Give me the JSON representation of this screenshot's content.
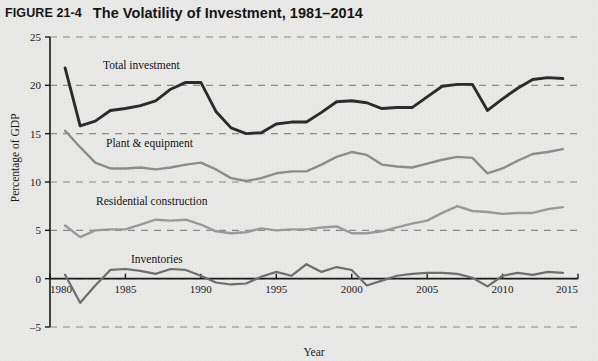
{
  "figure": {
    "number": "FIGURE 21-4",
    "title": "The Volatility of Investment, 1981–2014"
  },
  "colors": {
    "background": "#e9e9e7",
    "total_investment": "#2b2b2b",
    "plant_equipment": "#8d8d8d",
    "residential_construction": "#9a9a9a",
    "inventories": "#6e6e6e",
    "gridline": "#8c8c8c",
    "axis": "#1a1a1a"
  },
  "chart_data": {
    "type": "line",
    "title": "The Volatility of Investment, 1981–2014",
    "xlabel": "Year",
    "ylabel": "Percentage of GDP",
    "xlim": [
      1980,
      2015
    ],
    "ylim": [
      -5,
      25
    ],
    "xticks": [
      1980,
      1985,
      1990,
      1995,
      2000,
      2005,
      2010,
      2015
    ],
    "yticks": [
      -5,
      0,
      5,
      10,
      15,
      20,
      25
    ],
    "xticklabels": [
      "1980",
      "1985",
      "1990",
      "1995",
      "2000",
      "2005",
      "2010",
      "2015"
    ],
    "yticklabels": [
      "–5",
      "0",
      "5",
      "10",
      "15",
      "20",
      "25"
    ],
    "grid": "horizontal-dashed",
    "legend_position": "inline-labels",
    "x": [
      1981,
      1982,
      1983,
      1984,
      1985,
      1986,
      1987,
      1988,
      1989,
      1990,
      1991,
      1992,
      1993,
      1994,
      1995,
      1996,
      1997,
      1998,
      1999,
      2000,
      2001,
      2002,
      2003,
      2004,
      2005,
      2006,
      2007,
      2008,
      2009,
      2010,
      2011,
      2012,
      2013,
      2014
    ],
    "series": [
      {
        "name": "Total investment",
        "label": "Total investment",
        "color": "#2b2b2b",
        "values": [
          21.8,
          15.8,
          16.3,
          17.4,
          17.6,
          17.9,
          18.4,
          19.6,
          20.3,
          20.3,
          17.3,
          15.6,
          15.0,
          15.1,
          16.0,
          16.2,
          16.2,
          17.2,
          18.3,
          18.4,
          18.2,
          17.6,
          17.7,
          17.7,
          18.8,
          19.9,
          20.1,
          20.1,
          17.4,
          18.6,
          19.7,
          20.6,
          20.8,
          20.7
        ]
      },
      {
        "name": "Plant & equipment",
        "label": "Plant & equipment",
        "color": "#8d8d8d",
        "values": [
          15.3,
          13.6,
          12.0,
          11.4,
          11.4,
          11.5,
          11.3,
          11.5,
          11.8,
          12.0,
          11.3,
          10.4,
          10.1,
          10.4,
          10.9,
          11.1,
          11.1,
          11.8,
          12.6,
          13.1,
          12.8,
          11.8,
          11.6,
          11.5,
          11.9,
          12.3,
          12.6,
          12.5,
          10.9,
          11.4,
          12.2,
          12.9,
          13.1,
          13.4
        ]
      },
      {
        "name": "Residential construction",
        "label": "Residential construction",
        "color": "#9a9a9a",
        "values": [
          5.5,
          4.3,
          5.0,
          5.1,
          5.1,
          5.6,
          6.1,
          6.0,
          6.1,
          5.6,
          4.9,
          4.7,
          4.8,
          5.2,
          5.0,
          5.1,
          5.1,
          5.3,
          5.4,
          4.7,
          4.7,
          4.9,
          5.3,
          5.7,
          6.0,
          6.8,
          7.5,
          7.0,
          6.9,
          6.7,
          6.8,
          6.8,
          7.2,
          7.4
        ]
      },
      {
        "name": "Inventories",
        "label": "Inventories",
        "color": "#6e6e6e",
        "values": [
          0.4,
          -2.5,
          -0.7,
          0.9,
          1.0,
          0.8,
          0.5,
          1.0,
          0.9,
          0.3,
          -0.4,
          -0.6,
          -0.5,
          0.2,
          0.7,
          0.3,
          1.5,
          0.7,
          1.2,
          0.9,
          -0.7,
          -0.2,
          0.3,
          0.5,
          0.6,
          0.6,
          0.5,
          0.1,
          -0.8,
          0.3,
          0.6,
          0.4,
          0.7,
          0.6
        ]
      }
    ],
    "annotations": [
      {
        "text": "Total investment",
        "x_px": 103,
        "y_px": 69
      },
      {
        "text": "Plant & equipment",
        "x_px": 106,
        "y_px": 147
      },
      {
        "text": "Residential construction",
        "x_px": 96,
        "y_px": 205
      },
      {
        "text": "Inventories",
        "x_px": 131,
        "y_px": 263
      }
    ]
  }
}
